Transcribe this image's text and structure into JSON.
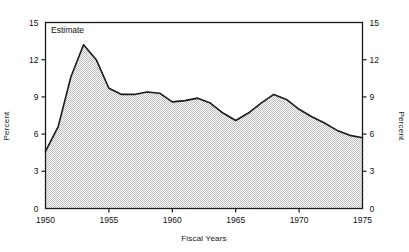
{
  "chart_data": {
    "type": "area",
    "title": "",
    "xlabel": "Fiscal Years",
    "ylabel": "Percent",
    "ylabel_right": "Percent",
    "annotation": "Estimate",
    "xlim": [
      1950,
      1975
    ],
    "ylim": [
      0,
      15
    ],
    "xticks": [
      1950,
      1955,
      1960,
      1965,
      1970,
      1975
    ],
    "xticklabels": [
      "1950",
      "1955",
      "1960",
      "1965",
      "1970",
      "1975"
    ],
    "yticks": [
      0,
      3,
      6,
      9,
      12,
      15
    ],
    "yticklabels": [
      "0",
      "3",
      "6",
      "9",
      "12",
      "15"
    ],
    "yticklabels_right": [
      "0",
      "3",
      "6",
      "9",
      "12",
      "15"
    ],
    "grid": true,
    "grid_axis": "both",
    "grid_clipped_to_area": true,
    "legend": "none",
    "fill_pattern": "checkerboard-dither",
    "fill_color": "#c8c8c8",
    "line_color": "#1a1a1a",
    "x": [
      1950,
      1951,
      1952,
      1953,
      1954,
      1955,
      1956,
      1957,
      1958,
      1959,
      1960,
      1961,
      1962,
      1963,
      1964,
      1965,
      1966,
      1967,
      1968,
      1969,
      1970,
      1971,
      1972,
      1973,
      1974,
      1975
    ],
    "values": [
      4.6,
      6.6,
      10.6,
      13.2,
      12.0,
      9.7,
      9.2,
      9.2,
      9.4,
      9.3,
      8.6,
      8.7,
      8.9,
      8.5,
      7.7,
      7.1,
      7.7,
      8.5,
      9.2,
      8.8,
      8.0,
      7.4,
      6.9,
      6.3,
      5.9,
      5.7
    ],
    "series": [
      {
        "name": "Percent",
        "values": [
          4.6,
          6.6,
          10.6,
          13.2,
          12.0,
          9.7,
          9.2,
          9.2,
          9.4,
          9.3,
          8.6,
          8.7,
          8.9,
          8.5,
          7.7,
          7.1,
          7.7,
          8.5,
          9.2,
          8.8,
          8.0,
          7.4,
          6.9,
          6.3,
          5.9,
          5.7
        ]
      }
    ]
  }
}
